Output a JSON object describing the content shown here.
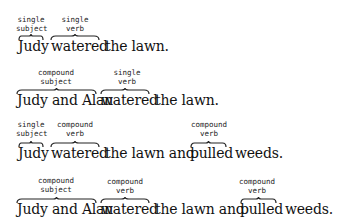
{
  "sentences": [
    {
      "groups": [
        {
          "label": [
            "single",
            "subject"
          ],
          "text": "Judy",
          "braced": true
        },
        {
          "label": [
            "single",
            "verb"
          ],
          "text": "watered",
          "braced": true
        },
        {
          "text": "the lawn.",
          "braced": false
        }
      ]
    },
    {
      "groups": [
        {
          "label": [
            "compound",
            "subject"
          ],
          "text": "Judy and Alan",
          "braced": true
        },
        {
          "label": [
            "single",
            "verb"
          ],
          "text": "watered",
          "braced": true
        },
        {
          "text": "the lawn.",
          "braced": false
        }
      ]
    },
    {
      "groups": [
        {
          "label": [
            "single",
            "subject"
          ],
          "text": "Judy",
          "braced": true
        },
        {
          "label": [
            "compound",
            "verb"
          ],
          "text": "watered",
          "braced": true
        },
        {
          "text": "the lawn and",
          "braced": false
        },
        {
          "label": [
            "compound",
            "verb"
          ],
          "text": "pulled",
          "braced": true
        },
        {
          "text": "weeds.",
          "braced": false
        }
      ]
    },
    {
      "groups": [
        {
          "label": [
            "compound",
            "subject"
          ],
          "text": "Judy and Alan",
          "braced": true
        },
        {
          "label": [
            "compound",
            "verb"
          ],
          "text": "watered",
          "braced": true
        },
        {
          "text": "the lawn and",
          "braced": false
        },
        {
          "label": [
            "compound",
            "verb"
          ],
          "text": "pulled",
          "braced": true
        },
        {
          "text": "weeds.",
          "braced": false
        }
      ]
    }
  ]
}
